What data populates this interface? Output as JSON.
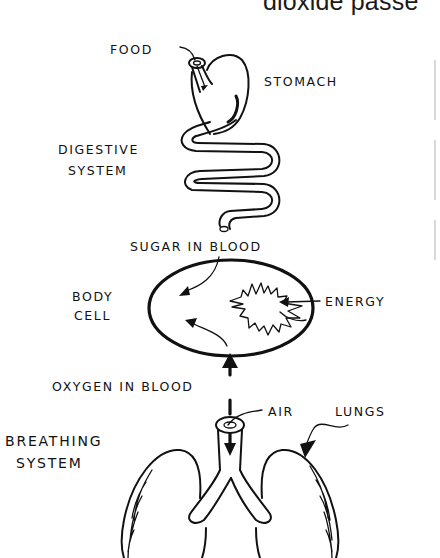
{
  "header": {
    "partial_text": "dioxide passe"
  },
  "diagram": {
    "title": "",
    "labels": {
      "food": "FOOD",
      "stomach": "STOMACH",
      "digestive_line1": "DIGESTIVE",
      "digestive_line2": "SYSTEM",
      "sugar_in_blood": "SUGAR IN BLOOD",
      "body_line1": "BODY",
      "body_line2": "CELL",
      "energy": "ENERGY",
      "oxygen_in_blood": "OXYGEN IN BLOOD",
      "air": "AIR",
      "lungs": "LUNGS",
      "breathing_line1": "BREATHING",
      "breathing_line2": "SYSTEM"
    },
    "nodes": [
      {
        "id": "food",
        "label": "FOOD"
      },
      {
        "id": "stomach",
        "label": "STOMACH"
      },
      {
        "id": "digestive-system",
        "label": "DIGESTIVE SYSTEM"
      },
      {
        "id": "sugar-in-blood",
        "label": "SUGAR IN BLOOD"
      },
      {
        "id": "body-cell",
        "label": "BODY CELL"
      },
      {
        "id": "energy",
        "label": "ENERGY"
      },
      {
        "id": "oxygen-in-blood",
        "label": "OXYGEN IN BLOOD"
      },
      {
        "id": "air",
        "label": "AIR"
      },
      {
        "id": "lungs",
        "label": "LUNGS"
      },
      {
        "id": "breathing-system",
        "label": "BREATHING SYSTEM"
      }
    ],
    "edges": [
      {
        "from": "food",
        "to": "stomach"
      },
      {
        "from": "stomach",
        "to": "digestive-system"
      },
      {
        "from": "digestive-system",
        "to": "sugar-in-blood"
      },
      {
        "from": "sugar-in-blood",
        "to": "body-cell"
      },
      {
        "from": "air",
        "to": "lungs"
      },
      {
        "from": "breathing-system",
        "to": "oxygen-in-blood"
      },
      {
        "from": "oxygen-in-blood",
        "to": "body-cell"
      },
      {
        "from": "body-cell",
        "to": "energy"
      }
    ]
  }
}
